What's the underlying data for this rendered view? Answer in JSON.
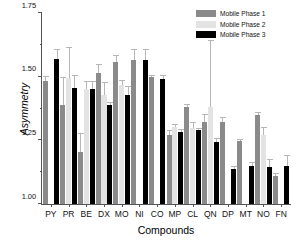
{
  "chart_data": {
    "type": "bar",
    "title": "",
    "xlabel": "Compounds",
    "ylabel": "Asymmetry",
    "ylim": [
      1.0,
      1.75
    ],
    "yticks": [
      1.0,
      1.25,
      1.5,
      1.75
    ],
    "ytick_labels": [
      "1.00",
      "1.25",
      "1.50",
      "1.75"
    ],
    "yminor_ticks": [
      1.125,
      1.375,
      1.625
    ],
    "grid": false,
    "legend_position": "top-right",
    "error_bars": "std-dev, upper caps shown",
    "categories": [
      "PY",
      "PR",
      "BE",
      "DX",
      "MO",
      "NI",
      "CO",
      "MP",
      "CL",
      "QN",
      "DP",
      "MT",
      "NO",
      "FN"
    ],
    "series": [
      {
        "name": "Mobile Phase 1",
        "color": "#8a8a8a",
        "values": [
          1.482,
          1.388,
          1.205,
          1.516,
          1.556,
          1.566,
          1.498,
          1.27,
          1.379,
          1.322,
          1.322,
          1.249,
          1.348,
          1.11
        ],
        "errors": [
          0.022,
          0.11,
          0.073,
          0.035,
          0.03,
          0.042,
          0.01,
          0.02,
          0.014,
          0.032,
          0.021,
          0.008,
          0.012,
          0.012
        ]
      },
      {
        "name": "Mobile Phase 2",
        "color": "#e3e3e3",
        "values": [
          1.0,
          1.493,
          1.452,
          1.43,
          1.468,
          1.0,
          1.0,
          1.303,
          1.299,
          1.379,
          1.0,
          1.0,
          1.272,
          1.0
        ],
        "errors": [
          0.0,
          0.124,
          0.03,
          0.048,
          0.02,
          0.0,
          0.0,
          0.012,
          0.022,
          0.264,
          0.0,
          0.0,
          0.03,
          0.0
        ]
      },
      {
        "name": "Mobile Phase 3",
        "color": "#000000",
        "values": [
          1.568,
          1.455,
          1.452,
          1.388,
          1.428,
          1.566,
          1.489,
          1.281,
          1.289,
          1.243,
          1.136,
          1.148,
          1.145,
          1.15
        ],
        "errors": [
          0.04,
          0.052,
          0.03,
          0.013,
          0.035,
          0.043,
          0.016,
          0.014,
          0.01,
          0.018,
          0.012,
          0.018,
          0.032,
          0.042
        ]
      }
    ]
  },
  "legend": {
    "items": [
      {
        "label": "Mobile Phase 1"
      },
      {
        "label": "Mobile Phase 2"
      },
      {
        "label": "Mobile Phase 3"
      }
    ]
  }
}
